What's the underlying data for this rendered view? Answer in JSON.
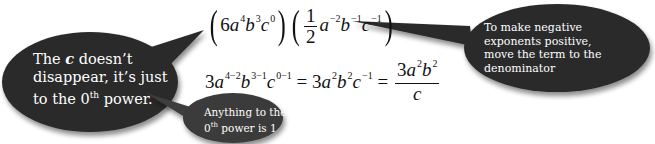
{
  "colors": {
    "bubble_fill": "#2b2b2b",
    "small_bubble_fill": "#3a3a3a",
    "bubble_text": "#ffffff",
    "math_text": "#111111",
    "background": "#ffffff"
  },
  "equation_line1": {
    "term1": {
      "coef": "6",
      "a_exp": "4",
      "b_exp": "3",
      "c_exp": "0"
    },
    "term2": {
      "frac_num": "1",
      "frac_den": "2",
      "a_exp": "−2",
      "b_exp": "−1",
      "c_exp": "−1"
    }
  },
  "equation_line2": {
    "step1": {
      "coef": "3",
      "a_exp": "4−2",
      "b_exp": "3−1",
      "c_exp": "0−1"
    },
    "equals1": "=",
    "step2": {
      "coef": "3",
      "a_exp": "2",
      "b_exp": "2",
      "c_exp": "−1"
    },
    "equals2": "=",
    "result": {
      "numerator_coef": "3",
      "a_exp": "2",
      "b_exp": "2",
      "denominator": "c"
    }
  },
  "callouts": {
    "left": {
      "line1_pre": "The ",
      "line1_var": "c",
      "line1_post": " doesn’t",
      "line2": "disappear, it’s just",
      "line3_pre": "to the 0",
      "line3_sup": "th",
      "line3_post": " power."
    },
    "bottom": {
      "line1": "Anything to the",
      "line2_pre": "0",
      "line2_sup": "th",
      "line2_post": " power is 1"
    },
    "right": {
      "line1": "To make negative",
      "line2": "exponents positive,",
      "line3": "move the term to the",
      "line4": "denominator"
    }
  }
}
